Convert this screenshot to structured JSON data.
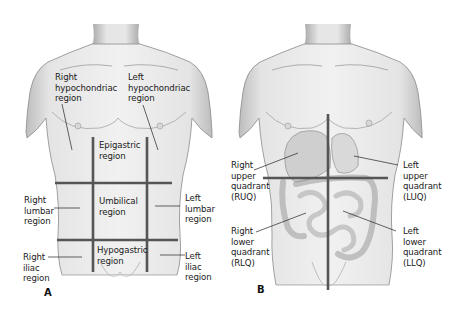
{
  "figure": {
    "panels": [
      {
        "id": "A",
        "panel_label": "A",
        "title": "Nine abdominal regions",
        "regions": [
          {
            "key": "right_hypochondriac",
            "label": "Right\nhypochondriac\nregion"
          },
          {
            "key": "left_hypochondriac",
            "label": "Left\nhypochondriac\nregion"
          },
          {
            "key": "epigastric",
            "label": "Epigastric\nregion"
          },
          {
            "key": "right_lumbar",
            "label": "Right\nlumbar\nregion"
          },
          {
            "key": "umbilical",
            "label": "Umbilical\nregion"
          },
          {
            "key": "left_lumbar",
            "label": "Left\nlumbar\nregion"
          },
          {
            "key": "right_iliac",
            "label": "Right\niliac\nregion"
          },
          {
            "key": "hypogastric",
            "label": "Hypogastric\nregion"
          },
          {
            "key": "left_iliac",
            "label": "Left\niliac\nregion"
          }
        ]
      },
      {
        "id": "B",
        "panel_label": "B",
        "title": "Four abdominal quadrants",
        "regions": [
          {
            "key": "ruq",
            "label": "Right\nupper\nquadrant\n(RUQ)"
          },
          {
            "key": "luq",
            "label": "Left\nupper\nquadrant\n(LUQ)"
          },
          {
            "key": "rlq",
            "label": "Right\nlower\nquadrant\n(RLQ)"
          },
          {
            "key": "llq",
            "label": "Left\nlower\nquadrant\n(LLQ)"
          }
        ]
      }
    ],
    "colors": {
      "background": "#ffffff",
      "skin_light": "#efefef",
      "skin_mid": "#d6d6d6",
      "skin_shadow": "#9a9a9a",
      "outline": "#6a6a6a",
      "grid_line": "#555555",
      "leader_line": "#222222",
      "text": "#1a1a1a"
    }
  }
}
